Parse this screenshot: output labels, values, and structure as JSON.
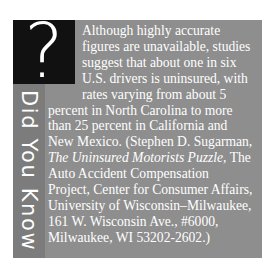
{
  "sidebar": {
    "icon": "question-mark-icon",
    "icon_glyph": "?",
    "label": "Did You Know"
  },
  "content": {
    "lines": [
      "Although highly accurate",
      "figures are unavailable, studies",
      "suggest that about one in six",
      "U.S. drivers is uninsured, with",
      "rates varying from about 5",
      "percent in North Carolina to more",
      "than 25 percent in California and",
      "New Mexico. (Stephen D. Sugarman,",
      "The Uninsured Motorists Puzzle",
      ", The",
      "Auto Accident Compensation",
      "Project, Center for Consumer Affairs,",
      "University of Wisconsin–Milwaukee,",
      "161 W. Wisconsin Ave., #6000,",
      "Milwaukee, WI 53202-2602.)"
    ]
  },
  "colors": {
    "background": "#ffffff",
    "panel": "#8e8e8e",
    "strip": "#7c7c7c",
    "icon_box": "#111111",
    "text": "#ffffff"
  }
}
